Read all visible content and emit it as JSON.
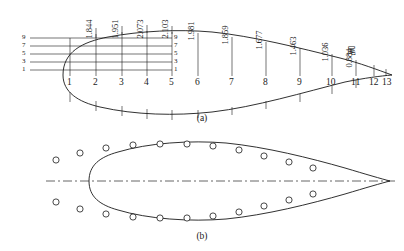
{
  "figure": {
    "panels": [
      {
        "caption": "(a)",
        "name": "profile-view"
      },
      {
        "caption": "(b)",
        "name": "plan-view"
      }
    ],
    "tail_label": "尾",
    "stations": [
      "1",
      "2",
      "3",
      "4",
      "5",
      "6",
      "7",
      "8",
      "9",
      "10",
      "11",
      "12",
      "13"
    ],
    "offsets": [
      {
        "station": "2",
        "value": "1.844"
      },
      {
        "station": "3",
        "value": "1.951"
      },
      {
        "station": "4",
        "value": "2.073"
      },
      {
        "station": "5",
        "value": "2.103"
      },
      {
        "station": "6",
        "value": "1.981"
      },
      {
        "station": "7",
        "value": "1.859"
      },
      {
        "station": "8",
        "value": "1.677"
      },
      {
        "station": "9",
        "value": "1.463"
      },
      {
        "station": "10",
        "value": "1.036"
      },
      {
        "station": "11",
        "value": "0.884"
      }
    ],
    "waterlines_left": [
      "9",
      "7",
      "5",
      "3",
      "1"
    ],
    "waterlines_right": [
      "9",
      "7",
      "5",
      "3",
      "1"
    ],
    "marker_count_per_side": 13,
    "colors": {
      "line": "#1a1a1a",
      "centerline": "#555555",
      "marker_fill": "#ffffff",
      "background": "#ffffff"
    }
  }
}
